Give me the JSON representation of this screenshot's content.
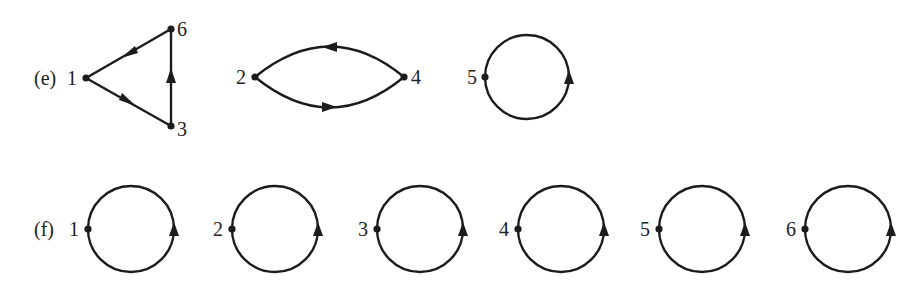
{
  "diagram": {
    "type": "permutation cycle digraphs",
    "parts": [
      {
        "label": "(e)",
        "cycles": [
          {
            "nodes": [
              "1",
              "3",
              "6"
            ],
            "edges": [
              [
                "1",
                "3"
              ],
              [
                "3",
                "6"
              ],
              [
                "6",
                "1"
              ]
            ],
            "shape": "triangle"
          },
          {
            "nodes": [
              "2",
              "4"
            ],
            "edges": [
              [
                "2",
                "4"
              ],
              [
                "4",
                "2"
              ]
            ],
            "shape": "lens"
          },
          {
            "nodes": [
              "5"
            ],
            "edges": [
              [
                "5",
                "5"
              ]
            ],
            "shape": "loop"
          }
        ]
      },
      {
        "label": "(f)",
        "cycles": [
          {
            "nodes": [
              "1"
            ],
            "edges": [
              [
                "1",
                "1"
              ]
            ],
            "shape": "loop"
          },
          {
            "nodes": [
              "2"
            ],
            "edges": [
              [
                "2",
                "2"
              ]
            ],
            "shape": "loop"
          },
          {
            "nodes": [
              "3"
            ],
            "edges": [
              [
                "3",
                "3"
              ]
            ],
            "shape": "loop"
          },
          {
            "nodes": [
              "4"
            ],
            "edges": [
              [
                "4",
                "4"
              ]
            ],
            "shape": "loop"
          },
          {
            "nodes": [
              "5"
            ],
            "edges": [
              [
                "5",
                "5"
              ]
            ],
            "shape": "loop"
          },
          {
            "nodes": [
              "6"
            ],
            "edges": [
              [
                "6",
                "6"
              ]
            ],
            "shape": "loop"
          }
        ]
      }
    ]
  },
  "labels": {
    "e": "(e)",
    "f": "(f)",
    "e_n1": "1",
    "e_n6": "6",
    "e_n3": "3",
    "e_n2": "2",
    "e_n4": "4",
    "e_n5": "5",
    "f_n1": "1",
    "f_n2": "2",
    "f_n3": "3",
    "f_n4": "4",
    "f_n5": "5",
    "f_n6": "6"
  },
  "colors": {
    "ink": "#1c1c1c",
    "background": "#ffffff"
  }
}
